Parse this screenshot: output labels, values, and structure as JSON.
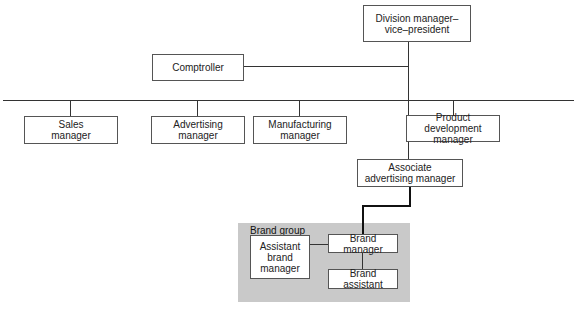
{
  "diagram": {
    "type": "organization-chart",
    "nodes": {
      "division_manager": "Division manager–\nvice–president",
      "comptroller": "Comptroller",
      "sales": "Sales\nmanager",
      "advertising": "Advertising\nmanager",
      "manufacturing": "Manufacturing\nmanager",
      "product_dev": "Product development\nmanager",
      "associate": "Associate\nadvertising manager",
      "assistant_brand": "Assistant\nbrand\nmanager",
      "brand_manager": "Brand manager",
      "brand_assistant": "Brand assistant"
    },
    "group": {
      "label": "Brand group",
      "fill": "#c9c9c9"
    },
    "edges": [
      [
        "division_manager",
        "comptroller"
      ],
      [
        "division_manager",
        "sales"
      ],
      [
        "division_manager",
        "advertising"
      ],
      [
        "division_manager",
        "manufacturing"
      ],
      [
        "division_manager",
        "product_dev"
      ],
      [
        "division_manager",
        "associate"
      ],
      [
        "associate",
        "brand_manager"
      ],
      [
        "brand_manager",
        "assistant_brand"
      ],
      [
        "brand_manager",
        "brand_assistant"
      ]
    ]
  }
}
